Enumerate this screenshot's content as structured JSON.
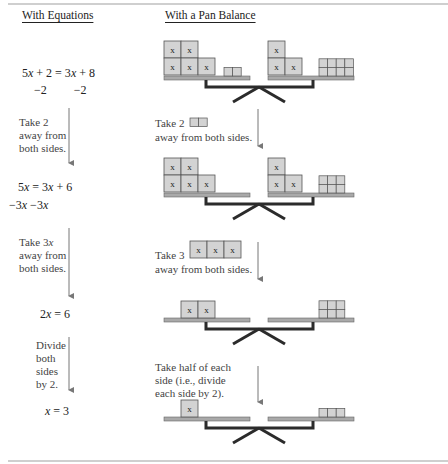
{
  "headers": {
    "equations": "With Equations",
    "balance": "With a Pan Balance"
  },
  "equations": [
    {
      "id": "eq1",
      "text": "5x + 2 = 3x + 8"
    },
    {
      "id": "eq1-sub",
      "text": "−2         −2"
    },
    {
      "id": "eq2",
      "text": "5x = 3x + 6"
    },
    {
      "id": "eq2-sub",
      "text": "−3x −3x"
    },
    {
      "id": "eq3",
      "text": "2x = 6"
    },
    {
      "id": "eq4",
      "text": "x = 3"
    }
  ],
  "equation_steps": [
    {
      "text": "Take 2\naway from\nboth sides."
    },
    {
      "text": "Take 3x\naway from\nboth sides."
    },
    {
      "text": "Divide\nboth\nsides\nby 2."
    }
  ],
  "balance_steps": [
    {
      "prefix": "Take 2",
      "suffix": "away from both sides."
    },
    {
      "prefix": "Take 3",
      "suffix": "away from both sides."
    },
    {
      "text": "Take half of each\nside (i.e., divide\neach side by 2)."
    }
  ],
  "balances": [
    {
      "left": {
        "x_tiles": 5,
        "units": 2
      },
      "right": {
        "x_tiles": 3,
        "units": 8
      }
    },
    {
      "left": {
        "x_tiles": 5,
        "units": 0
      },
      "right": {
        "x_tiles": 3,
        "units": 6
      }
    },
    {
      "left": {
        "x_tiles": 2,
        "units": 0
      },
      "right": {
        "x_tiles": 0,
        "units": 6
      }
    },
    {
      "left": {
        "x_tiles": 1,
        "units": 0
      },
      "right": {
        "x_tiles": 0,
        "units": 3
      }
    }
  ],
  "tile_label": "x",
  "colors": {
    "tile_fill": "#d3d3d3",
    "tile_stroke": "#555555",
    "pan_fill": "#a9a9a9",
    "beam": "#2b2b2b",
    "arrow": "#777777"
  }
}
